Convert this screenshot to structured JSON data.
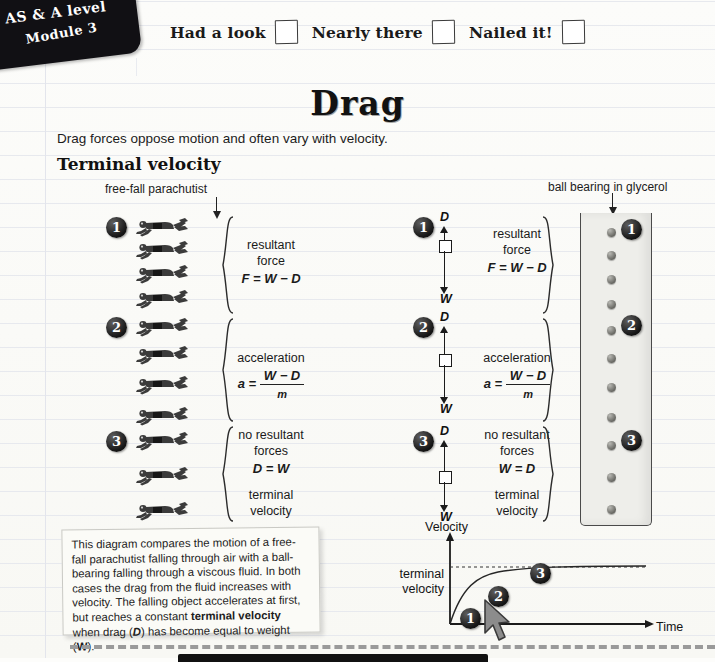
{
  "corner_tab": {
    "line1": "AS & A level",
    "line2": "Module 3"
  },
  "progress": {
    "items": [
      {
        "label": "Had a look"
      },
      {
        "label": "Nearly there"
      },
      {
        "label": "Nailed it!"
      }
    ]
  },
  "page": {
    "title": "Drag",
    "intro": "Drag forces oppose motion and often vary with velocity.",
    "section_heading": "Terminal velocity"
  },
  "diagram": {
    "left_caption": "free-fall parachutist",
    "right_caption": "ball bearing in glycerol",
    "stages": [
      {
        "number": "1",
        "line1": "resultant",
        "line2": "force",
        "equation": "F = W − D",
        "force_up_label": "D",
        "force_down_label": "W"
      },
      {
        "number": "2",
        "line1": "acceleration",
        "line2": "",
        "equation_lhs": "a =",
        "equation_num": "W − D",
        "equation_den": "m",
        "force_up_label": "D",
        "force_down_label": "W"
      },
      {
        "number": "3",
        "line1": "no resultant",
        "line2": "forces",
        "equation": "D = W",
        "equation_middle": "W = D",
        "extra_line1": "terminal",
        "extra_line2": "velocity",
        "force_up_label": "D",
        "force_down_label": "W"
      }
    ]
  },
  "note": {
    "text_parts": [
      "This diagram compares the motion of a free-fall parachutist falling through air with a ball-bearing falling through a viscous fluid. In both cases the drag from the fluid increases with velocity. The falling object accelerates at first, but reaches a constant ",
      "terminal velocity",
      " when drag (",
      "D",
      ") has become equal to weight (",
      "W",
      ")."
    ]
  },
  "chart_data": {
    "type": "line",
    "title": "",
    "xlabel": "Time",
    "ylabel": "Velocity",
    "ylim": [
      0,
      1.15
    ],
    "xlim": [
      0,
      1
    ],
    "grid": false,
    "legend": null,
    "annotations": [
      {
        "label": "terminal velocity",
        "type": "axis-note",
        "y": 1.0
      },
      {
        "label": "1",
        "x": 0.09,
        "y": 0.12
      },
      {
        "label": "2",
        "x": 0.25,
        "y": 0.43
      },
      {
        "label": "3",
        "x": 0.52,
        "y": 0.83
      }
    ],
    "series": [
      {
        "name": "velocity",
        "x": [
          0.0,
          0.05,
          0.1,
          0.15,
          0.2,
          0.3,
          0.4,
          0.55,
          0.7,
          0.85,
          1.0
        ],
        "values": [
          0.0,
          0.27,
          0.45,
          0.58,
          0.68,
          0.81,
          0.89,
          0.95,
          0.98,
          0.99,
          1.0
        ]
      }
    ],
    "reference_lines": [
      {
        "label": "terminal velocity",
        "y": 1.0,
        "style": "dashed"
      }
    ]
  },
  "graph_labels": {
    "y_axis": "Velocity",
    "x_axis": "Time",
    "terminal_line1": "terminal",
    "terminal_line2": "velocity",
    "points": [
      "1",
      "2",
      "3"
    ]
  }
}
